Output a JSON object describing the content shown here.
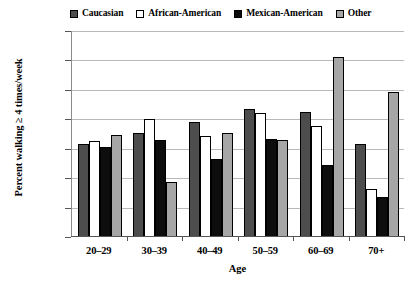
{
  "chart_data": {
    "type": "bar",
    "title": "",
    "xlabel": "Age",
    "ylabel": "Percent walking ≥ 4 times/week",
    "categories": [
      "20–29",
      "30–39",
      "40–49",
      "50–59",
      "60–69",
      "70+"
    ],
    "series": [
      {
        "name": "Caucasian",
        "color": "#4d4d4d",
        "values": [
          15.8,
          17.7,
          19.5,
          21.7,
          21.2,
          15.8
        ]
      },
      {
        "name": "African-American",
        "color": "#ffffff",
        "values": [
          16.3,
          20.0,
          17.2,
          21.0,
          18.9,
          8.2
        ]
      },
      {
        "name": "Mexican-American",
        "color": "#0d0d0d",
        "values": [
          15.3,
          16.4,
          13.3,
          16.6,
          12.3,
          6.8
        ]
      },
      {
        "name": "Other",
        "color": "#a6a6a6",
        "values": [
          17.4,
          9.4,
          17.7,
          16.4,
          30.6,
          24.6
        ]
      }
    ],
    "ylim": [
      0,
      35
    ],
    "yticks": [
      0,
      5,
      10,
      15,
      20,
      25,
      30,
      35
    ],
    "ytick_labels": [
      "0",
      "5",
      "10",
      "15",
      "20",
      "25",
      "30",
      "35"
    ],
    "grid": true,
    "legend_position": "top"
  }
}
